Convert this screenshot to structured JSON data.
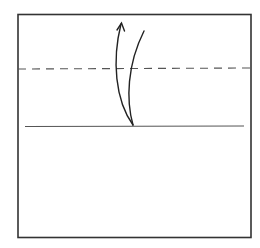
{
  "diagram": {
    "type": "origami-fold-step",
    "colors": {
      "background": "#ffffff",
      "stroke": "#222222",
      "paper_edge": "#333333"
    },
    "paper": {
      "x": 18,
      "y": 14,
      "width": 233,
      "height": 223
    },
    "fold_line": {
      "style": "dashed",
      "label": "valley-fold-line",
      "y": 69
    },
    "reference_line": {
      "style": "solid",
      "label": "crease-line",
      "y": 126,
      "x1": 25,
      "x2": 244
    },
    "arrow": {
      "label": "fold-up-arrow",
      "direction": "up"
    }
  }
}
